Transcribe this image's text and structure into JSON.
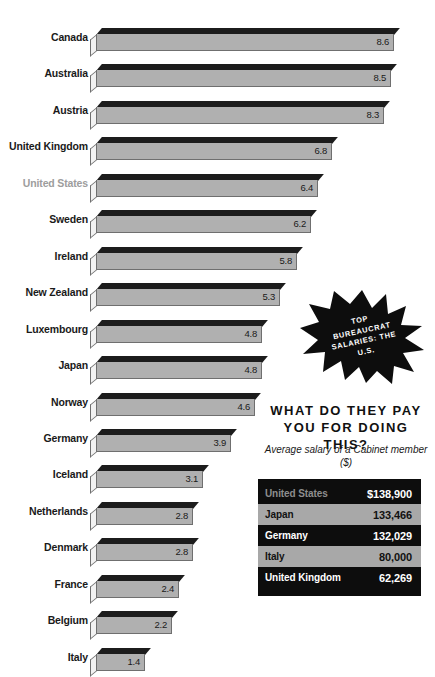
{
  "chart_data": {
    "type": "bar",
    "orientation": "horizontal",
    "title": "",
    "xlabel": "",
    "ylabel": "",
    "grid": false,
    "legend": false,
    "xlim": [
      0,
      8.6
    ],
    "categories": [
      "Canada",
      "Australia",
      "Austria",
      "United Kingdom",
      "United States",
      "Sweden",
      "Ireland",
      "New Zealand",
      "Luxembourg",
      "Japan",
      "Norway",
      "Germany",
      "Iceland",
      "Netherlands",
      "Denmark",
      "France",
      "Belgium",
      "Italy"
    ],
    "values": [
      8.6,
      8.5,
      8.3,
      6.8,
      6.4,
      6.2,
      5.8,
      5.3,
      4.8,
      4.8,
      4.6,
      3.9,
      3.1,
      2.8,
      2.8,
      2.4,
      2.2,
      1.4
    ],
    "highlighted_category": "United States",
    "bars": [
      {
        "label": "Canada",
        "value": 8.6,
        "value_text": "8.6",
        "highlight": false
      },
      {
        "label": "Australia",
        "value": 8.5,
        "value_text": "8.5",
        "highlight": false
      },
      {
        "label": "Austria",
        "value": 8.3,
        "value_text": "8.3",
        "highlight": false
      },
      {
        "label": "United Kingdom",
        "value": 6.8,
        "value_text": "6.8",
        "highlight": false
      },
      {
        "label": "United States",
        "value": 6.4,
        "value_text": "6.4",
        "highlight": true
      },
      {
        "label": "Sweden",
        "value": 6.2,
        "value_text": "6.2",
        "highlight": false
      },
      {
        "label": "Ireland",
        "value": 5.8,
        "value_text": "5.8",
        "highlight": false
      },
      {
        "label": "New Zealand",
        "value": 5.3,
        "value_text": "5.3",
        "highlight": false
      },
      {
        "label": "Luxembourg",
        "value": 4.8,
        "value_text": "4.8",
        "highlight": false
      },
      {
        "label": "Japan",
        "value": 4.8,
        "value_text": "4.8",
        "highlight": false
      },
      {
        "label": "Norway",
        "value": 4.6,
        "value_text": "4.6",
        "highlight": false
      },
      {
        "label": "Germany",
        "value": 3.9,
        "value_text": "3.9",
        "highlight": false
      },
      {
        "label": "Iceland",
        "value": 3.1,
        "value_text": "3.1",
        "highlight": false
      },
      {
        "label": "Netherlands",
        "value": 2.8,
        "value_text": "2.8",
        "highlight": false
      },
      {
        "label": "Denmark",
        "value": 2.8,
        "value_text": "2.8",
        "highlight": false
      },
      {
        "label": "France",
        "value": 2.4,
        "value_text": "2.4",
        "highlight": false
      },
      {
        "label": "Belgium",
        "value": 2.2,
        "value_text": "2.2",
        "highlight": false
      },
      {
        "label": "Italy",
        "value": 1.4,
        "value_text": "1.4",
        "highlight": false
      }
    ]
  },
  "starburst": {
    "text": "TOP BUREAUCRAT SALARIES: THE U.S.",
    "fill_color": "#0d0d0d",
    "text_color": "#ffffff"
  },
  "callout": {
    "headline": "WHAT DO THEY PAY YOU FOR DOING THIS?",
    "subtitle": "Average salary of a Cabinet member ($)"
  },
  "salary_table": {
    "rows": [
      {
        "country": "United States",
        "amount": "$138,900",
        "highlight": true
      },
      {
        "country": "Japan",
        "amount": "133,466",
        "highlight": false
      },
      {
        "country": "Germany",
        "amount": "132,029",
        "highlight": false
      },
      {
        "country": "Italy",
        "amount": "80,000",
        "highlight": false
      },
      {
        "country": "United Kingdom",
        "amount": "62,269",
        "highlight": false
      }
    ]
  },
  "colors": {
    "bar_front": "#b0b0b0",
    "bar_top": "#1c1c1c",
    "bar_cap": "#f2f2f2",
    "bar_outline": "#6f6f6f",
    "label": "#1a1a1a",
    "label_highlight": "#9d9d9d",
    "panel_background": "#0d0d0d",
    "panel_alt_row": "#a8a8a8"
  }
}
